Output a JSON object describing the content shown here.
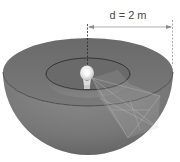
{
  "diagram": {
    "dimension_label": "d = 2 m",
    "elements": [
      {
        "name": "outer-hemisphere",
        "description": "Large hemispherical bowl of radius d"
      },
      {
        "name": "inner-hemisphere",
        "description": "Smaller concentric hemispherical bowl"
      },
      {
        "name": "light-bulb",
        "description": "Point light source at common center"
      },
      {
        "name": "radius-dimension",
        "description": "Horizontal arrow from center to rim, labeled d"
      },
      {
        "name": "light-cone",
        "description": "Translucent cone of light projecting onto surfaces"
      }
    ],
    "colors": {
      "background": "#ffffff",
      "bowl_outer": "#7a7a7a",
      "bowl_rim_top": "#6d6d6d",
      "bowl_shadow": "#5c5c5c",
      "inner_bowl": "#747474",
      "bulb": "#e8e8e8",
      "dimension_line": "#8a8a8a",
      "center_line": "#2a2a2a"
    }
  }
}
